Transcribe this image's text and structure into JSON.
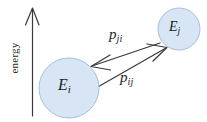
{
  "figure": {
    "background_color": "#ffffff",
    "stroke_color": "#3a3a3a",
    "circle_fill_color": "#d7e5f4",
    "circle_stroke_color": "#9fb9d6",
    "text_color": "#1c1c1c"
  },
  "axis": {
    "name": "energy-axis",
    "label": "energy",
    "direction": "up",
    "arrowhead": "open-v"
  },
  "states": [
    {
      "id": "lower-state",
      "symbol": "E",
      "subscript": "i",
      "label": "Ei",
      "cx": 69,
      "cy": 88,
      "r": 30
    },
    {
      "id": "upper-state",
      "symbol": "E",
      "subscript": "j",
      "label": "Ej",
      "cx": 179,
      "cy": 29,
      "r": 21
    }
  ],
  "transitions": [
    {
      "id": "downward-transition",
      "symbol": "p",
      "subscript": "ji",
      "label": "pji",
      "from": "upper-state",
      "to": "lower-state",
      "direction": "down-left"
    },
    {
      "id": "upward-transition",
      "symbol": "p",
      "subscript": "ij",
      "label": "pij",
      "from": "lower-state",
      "to": "upper-state",
      "direction": "up-right"
    }
  ]
}
